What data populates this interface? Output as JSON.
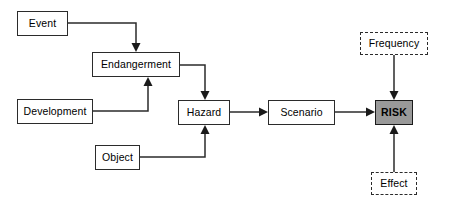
{
  "diagram": {
    "background_color": "#ffffff",
    "line_color": "#2b2b2b",
    "node_fill": "#ffffff",
    "risk_fill": "#999999",
    "nodes": [
      {
        "id": "event",
        "label": "Event",
        "x": 17,
        "y": 11,
        "w": 51,
        "h": 25,
        "style": "solid"
      },
      {
        "id": "endangerment",
        "label": "Endangerment",
        "x": 92,
        "y": 52,
        "w": 88,
        "h": 25,
        "style": "solid"
      },
      {
        "id": "development",
        "label": "Development",
        "x": 17,
        "y": 99,
        "w": 76,
        "h": 25,
        "style": "solid"
      },
      {
        "id": "object",
        "label": "Object",
        "x": 95,
        "y": 145,
        "w": 45,
        "h": 25,
        "style": "solid"
      },
      {
        "id": "hazard",
        "label": "Hazard",
        "x": 178,
        "y": 100,
        "w": 52,
        "h": 25,
        "style": "solid"
      },
      {
        "id": "scenario",
        "label": "Scenario",
        "x": 268,
        "y": 100,
        "w": 67,
        "h": 25,
        "style": "solid"
      },
      {
        "id": "frequency",
        "label": "Frequency",
        "x": 360,
        "y": 32,
        "w": 68,
        "h": 23,
        "style": "dashdot"
      },
      {
        "id": "risk",
        "label": "RISK",
        "x": 375,
        "y": 100,
        "w": 38,
        "h": 25,
        "style": "risk"
      },
      {
        "id": "effect",
        "label": "Effect",
        "x": 371,
        "y": 172,
        "w": 46,
        "h": 23,
        "style": "dashdot"
      }
    ],
    "edges": [
      {
        "id": "event-to-endangerment",
        "from": "Event",
        "to": "Endangerment",
        "path": "M 68 23 L 136 23 L 136 50",
        "arrow_at": [
          136,
          52
        ],
        "arrow_dir": "down"
      },
      {
        "id": "development-to-endangerment",
        "from": "Development",
        "to": "Endangerment",
        "path": "M 93 111 L 148 111 L 148 79",
        "arrow_at": [
          148,
          77
        ],
        "arrow_dir": "up"
      },
      {
        "id": "endangerment-to-hazard",
        "from": "Endangerment",
        "to": "Hazard",
        "path": "M 180 65 L 205 65 L 205 98",
        "arrow_at": [
          205,
          100
        ],
        "arrow_dir": "down"
      },
      {
        "id": "object-to-hazard",
        "from": "Object",
        "to": "Hazard",
        "path": "M 140 157 L 205 157 L 205 127",
        "arrow_at": [
          205,
          125
        ],
        "arrow_dir": "up"
      },
      {
        "id": "hazard-to-scenario",
        "from": "Hazard",
        "to": "Scenario",
        "path": "M 230 112 L 266 112",
        "arrow_at": [
          268,
          112
        ],
        "arrow_dir": "right"
      },
      {
        "id": "scenario-to-risk",
        "from": "Scenario",
        "to": "RISK",
        "path": "M 335 112 L 373 112",
        "arrow_at": [
          375,
          112
        ],
        "arrow_dir": "right"
      },
      {
        "id": "frequency-to-risk",
        "from": "Frequency",
        "to": "RISK",
        "path": "M 394 55 L 394 98",
        "arrow_at": [
          394,
          100
        ],
        "arrow_dir": "down"
      },
      {
        "id": "effect-to-risk",
        "from": "Effect",
        "to": "RISK",
        "path": "M 394 172 L 394 127",
        "arrow_at": [
          394,
          125
        ],
        "arrow_dir": "up"
      }
    ]
  }
}
